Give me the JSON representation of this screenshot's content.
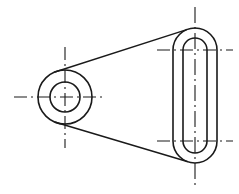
{
  "drawing": {
    "title": "Mechanical Part Outline Drawing",
    "description": "Two-dimensional engineering line drawing of a lever / link plate showing a circular boss with concentric through hole joined by a tapered web to an obround (slotted) end with a concentric inner slot.",
    "view": "front-view",
    "background_color": "#ffffff",
    "line_color": "#1a1a1a",
    "canvas": {
      "width": 239,
      "height": 194
    },
    "line_styles": {
      "visible_edge": "solid",
      "center_axis": "dash-dot",
      "visible_edge_width": 1.6,
      "center_axis_width": 1.1
    },
    "features": {
      "boss": {
        "name": "circular-boss",
        "center_x": 65,
        "center_y": 97,
        "outer_radius": 27,
        "hole_radius": 15,
        "hole_name": "through-hole"
      },
      "obround": {
        "name": "obround-end",
        "center_x": 195,
        "top_arc_center_y": 50,
        "bottom_arc_center_y": 141,
        "outer_half_width": 22,
        "outer_radius": 22,
        "inner_half_width": 12,
        "inner_radius": 12
      },
      "web": {
        "name": "tapered-web",
        "upper_tangent": {
          "x1": 68,
          "y1": 74,
          "x2": 190,
          "y2": 28
        },
        "lower_tangent": {
          "x1": 68,
          "y1": 120,
          "x2": 190,
          "y2": 166
        }
      },
      "centerlines": {
        "boss_horizontal": {
          "x1": 14,
          "y1": 97,
          "x2": 106,
          "y2": 97
        },
        "boss_vertical": {
          "x1": 65,
          "y1": 47,
          "x2": 65,
          "y2": 148
        },
        "obround_vertical": {
          "x1": 195,
          "y1": 7,
          "x2": 195,
          "y2": 187
        },
        "obround_top_horizontal": {
          "x1": 157,
          "y1": 50,
          "x2": 233,
          "y2": 50
        },
        "obround_bottom_horizontal": {
          "x1": 157,
          "y1": 141,
          "x2": 233,
          "y2": 141
        }
      }
    }
  }
}
